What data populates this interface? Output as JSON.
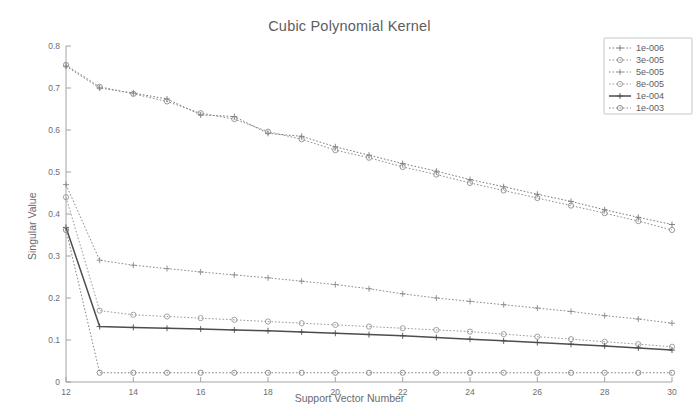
{
  "chart_data": {
    "type": "line",
    "title": "Cubic Polynomial Kernel",
    "xlabel": "Support Vector Number",
    "ylabel": "Singular Value",
    "xlim": [
      12,
      30
    ],
    "ylim": [
      0,
      0.8
    ],
    "xticks": [
      12,
      14,
      16,
      18,
      20,
      22,
      24,
      26,
      28,
      30
    ],
    "yticks": [
      0,
      0.1,
      0.2,
      0.3,
      0.4,
      0.5,
      0.6,
      0.7,
      0.8
    ],
    "ytick_labels": [
      "0",
      "0.1",
      "0.2",
      "0.3",
      "0.4",
      "0.5",
      "0.6",
      "0.7",
      "0.8"
    ],
    "xtick_labels": [
      "12",
      "14",
      "16",
      "18",
      "20",
      "22",
      "24",
      "26",
      "28",
      "30"
    ],
    "grid": false,
    "legend_position": "top-right",
    "x": [
      12,
      13,
      14,
      15,
      16,
      17,
      18,
      19,
      20,
      21,
      22,
      23,
      24,
      25,
      26,
      27,
      28,
      29,
      30
    ],
    "series": [
      {
        "name": "1e-006",
        "color": "#7a7a7d",
        "linestyle": "dotted",
        "marker": "plus",
        "values": [
          0.752,
          0.7,
          0.688,
          0.674,
          0.636,
          0.632,
          0.592,
          0.585,
          0.56,
          0.54,
          0.52,
          0.502,
          0.482,
          0.465,
          0.447,
          0.43,
          0.41,
          0.392,
          0.375
        ]
      },
      {
        "name": "3e-005",
        "color": "#8d8d90",
        "linestyle": "dotted",
        "marker": "circle",
        "values": [
          0.755,
          0.703,
          0.686,
          0.668,
          0.64,
          0.626,
          0.596,
          0.578,
          0.552,
          0.534,
          0.512,
          0.494,
          0.474,
          0.456,
          0.438,
          0.42,
          0.402,
          0.383,
          0.362
        ]
      },
      {
        "name": "5e-005",
        "color": "#8a8a8d",
        "linestyle": "dotted",
        "marker": "plus",
        "values": [
          0.47,
          0.29,
          0.278,
          0.27,
          0.262,
          0.255,
          0.248,
          0.24,
          0.232,
          0.222,
          0.21,
          0.2,
          0.192,
          0.184,
          0.176,
          0.168,
          0.158,
          0.15,
          0.14
        ]
      },
      {
        "name": "8e-005",
        "color": "#9a9a9d",
        "linestyle": "dotted",
        "marker": "circle",
        "values": [
          0.44,
          0.17,
          0.16,
          0.156,
          0.152,
          0.148,
          0.144,
          0.14,
          0.136,
          0.132,
          0.128,
          0.124,
          0.12,
          0.114,
          0.108,
          0.102,
          0.096,
          0.09,
          0.084
        ]
      },
      {
        "name": "1e-004",
        "color": "#4d4d50",
        "linestyle": "solid",
        "marker": "plus",
        "values": [
          0.368,
          0.132,
          0.13,
          0.128,
          0.126,
          0.124,
          0.122,
          0.119,
          0.116,
          0.113,
          0.11,
          0.106,
          0.102,
          0.098,
          0.094,
          0.09,
          0.086,
          0.081,
          0.076
        ]
      },
      {
        "name": "1e-003",
        "color": "#85858a",
        "linestyle": "dotted",
        "marker": "circle",
        "values": [
          0.362,
          0.022,
          0.022,
          0.022,
          0.022,
          0.022,
          0.022,
          0.022,
          0.022,
          0.022,
          0.022,
          0.022,
          0.022,
          0.022,
          0.022,
          0.022,
          0.022,
          0.022,
          0.022
        ]
      }
    ]
  },
  "legend": {
    "entries": [
      "1e-006",
      "3e-005",
      "5e-005",
      "8e-005",
      "1e-004",
      "1e-003"
    ]
  }
}
